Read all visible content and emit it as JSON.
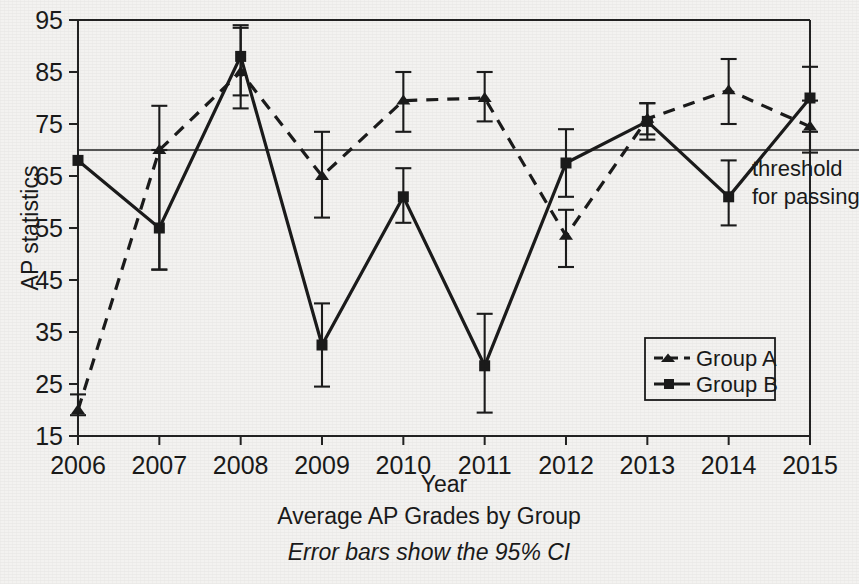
{
  "chart_data": {
    "type": "line",
    "title": "Average AP Grades by Group",
    "subtitle": "Error bars show the 95% CI",
    "xlabel": "Year",
    "ylabel": "AP statistics",
    "categories": [
      "2006",
      "2007",
      "2008",
      "2009",
      "2010",
      "2011",
      "2012",
      "2013",
      "2014",
      "2015"
    ],
    "x": [
      2006,
      2007,
      2008,
      2009,
      2010,
      2011,
      2012,
      2013,
      2014,
      2015
    ],
    "xlim": [
      2006,
      2015
    ],
    "ylim": [
      15,
      95
    ],
    "yticks": [
      15,
      25,
      35,
      45,
      55,
      65,
      75,
      85,
      95
    ],
    "grid": false,
    "legend_position": "bottom-right",
    "series": [
      {
        "name": "Group A",
        "style": "dashed",
        "marker": "triangle",
        "values": [
          20.0,
          70.0,
          85.0,
          65.0,
          79.5,
          80.0,
          53.5,
          76.0,
          81.5,
          74.5
        ],
        "ci_low": [
          19.0,
          47.0,
          78.0,
          57.0,
          73.5,
          75.5,
          47.5,
          73.0,
          75.0,
          69.5
        ],
        "ci_high": [
          23.0,
          78.5,
          93.5,
          73.5,
          85.0,
          85.0,
          58.5,
          79.0,
          87.5,
          79.5
        ]
      },
      {
        "name": "Group B",
        "style": "solid",
        "marker": "square",
        "values": [
          68.0,
          55.0,
          88.0,
          32.5,
          61.0,
          28.5,
          67.5,
          75.5,
          61.0,
          80.0
        ],
        "ci_low": [
          68.0,
          47.0,
          80.5,
          24.5,
          56.0,
          19.5,
          61.0,
          72.0,
          55.5,
          73.5
        ],
        "ci_high": [
          68.0,
          70.0,
          94.0,
          40.5,
          66.5,
          38.5,
          74.0,
          79.0,
          68.0,
          86.0
        ]
      }
    ],
    "reference_lines": [
      {
        "name": "threshold-for-passing",
        "value": 70,
        "label_line1": "threshold",
        "label_line2": "for passing",
        "orientation": "horizontal"
      }
    ]
  },
  "axes": {
    "y_title": "AP statistics",
    "x_title": "Year"
  },
  "annotation": {
    "threshold_line1": "threshold",
    "threshold_line2": "for passing"
  },
  "legend": {
    "items": [
      {
        "label": "Group A"
      },
      {
        "label": "Group B"
      }
    ]
  },
  "caption": {
    "title": "Average AP Grades by Group",
    "subtitle": "Error bars show the 95% CI"
  },
  "colors": {
    "ink": "#1b1b1b",
    "background": "#f3f2f0"
  }
}
